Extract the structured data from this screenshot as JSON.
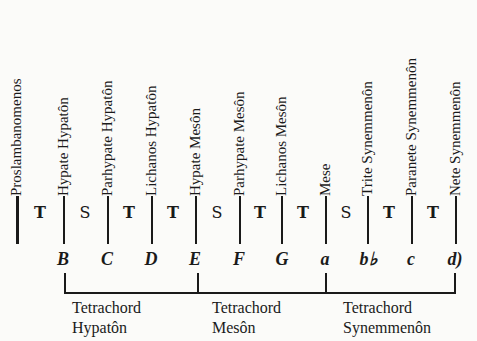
{
  "diagram": {
    "type": "greater-perfect-system-scale",
    "notes": [
      {
        "name": "Proslambanomenos",
        "letter": ""
      },
      {
        "name": "Hypate Hypatôn",
        "letter": "B"
      },
      {
        "name": "Parhypate Hypatôn",
        "letter": "C"
      },
      {
        "name": "Lichanos Hypatôn",
        "letter": "D"
      },
      {
        "name": "Hypate Mesôn",
        "letter": "E"
      },
      {
        "name": "Parhypate Mesôn",
        "letter": "F"
      },
      {
        "name": "Lichanos Mesôn",
        "letter": "G"
      },
      {
        "name": "Mese",
        "letter": "a"
      },
      {
        "name": "Trite Synemmenôn",
        "letter": "b♭"
      },
      {
        "name": "Paranete Synemmenôn",
        "letter": "c"
      },
      {
        "name": "Nete Synemmenôn",
        "letter": "d)"
      }
    ],
    "intervals": [
      "T",
      "S",
      "T",
      "T",
      "S",
      "T",
      "T",
      "S",
      "T",
      "T"
    ],
    "tetrachords": [
      {
        "line1": "Tetrachord",
        "line2": "Hypatôn"
      },
      {
        "line1": "Tetrachord",
        "line2": "Mesôn"
      },
      {
        "line1": "Tetrachord",
        "line2": "Synemmenôn"
      }
    ]
  }
}
